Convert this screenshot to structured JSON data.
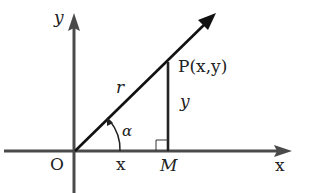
{
  "diagram": {
    "type": "coordinate-geometry",
    "labels": {
      "y_axis": "y",
      "x_axis": "x",
      "origin": "O",
      "point_p": "P(x,y)",
      "foot_m": "M",
      "radius": "r",
      "vertical_segment": "y",
      "horizontal_segment": "x",
      "angle": "α"
    },
    "colors": {
      "axis": "#4a4a4a",
      "ray": "#111111",
      "text": "#222222"
    }
  }
}
